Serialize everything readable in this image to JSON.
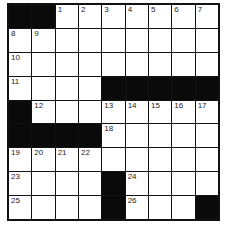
{
  "puzzle": {
    "rows": 9,
    "cols": 9,
    "grid": [
      [
        "#",
        "#",
        "1",
        "2",
        "3",
        "4",
        "5",
        "6",
        "7"
      ],
      [
        "8",
        "9",
        "",
        "",
        "",
        "",
        "",
        "",
        ""
      ],
      [
        "10",
        "",
        "",
        "",
        "",
        "",
        "",
        "",
        ""
      ],
      [
        "11",
        "",
        "",
        "",
        "#",
        "#",
        "#",
        "#",
        "#"
      ],
      [
        "#",
        "12",
        "",
        "",
        "13",
        "14",
        "15",
        "16",
        "17"
      ],
      [
        "#",
        "#",
        "#",
        "#",
        "18",
        "",
        "",
        "",
        ""
      ],
      [
        "19",
        "20",
        "21",
        "22",
        "",
        "",
        "",
        "",
        ""
      ],
      [
        "23",
        "",
        "",
        "",
        "#",
        "24",
        "",
        "",
        ""
      ],
      [
        "25",
        "",
        "",
        "",
        "#",
        "26",
        "",
        "",
        "#"
      ]
    ],
    "colors": {
      "block": "#0a0a0a",
      "cell": "#ffffff",
      "line": "#111111"
    }
  }
}
